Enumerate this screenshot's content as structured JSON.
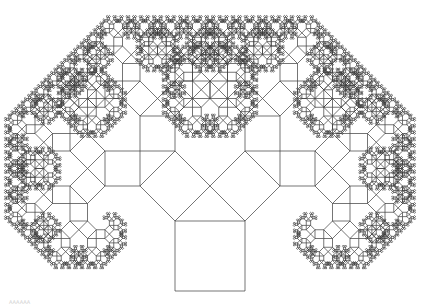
{
  "figure": {
    "type": "pythagoras-tree",
    "angle_degrees": 45,
    "trunk": {
      "x": 175,
      "y": 221,
      "size": 70
    },
    "depth": 11,
    "stroke_color": "#3a3a3a",
    "background": "#ffffff"
  },
  "caption": "AAAAAA"
}
